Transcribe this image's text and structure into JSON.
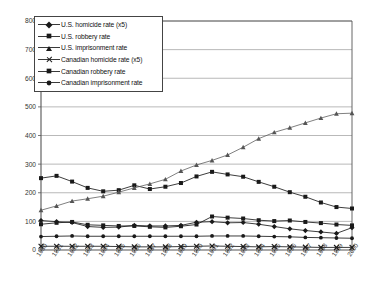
{
  "chart_data": {
    "type": "line",
    "title": "",
    "xlabel": "",
    "ylabel": "",
    "ylim": [
      0,
      800
    ],
    "ytick_values": [
      0,
      100,
      200,
      300,
      400,
      500,
      600,
      700,
      800
    ],
    "ytick_labels": [
      "0",
      "100",
      "200",
      "300",
      "400",
      "500",
      "600",
      "700",
      "800"
    ],
    "grid": true,
    "legend_position": "top-left inside",
    "x": [
      1980,
      1981,
      1982,
      1983,
      1984,
      1985,
      1986,
      1987,
      1988,
      1989,
      1990,
      1991,
      1992,
      1993,
      1994,
      1995,
      1996,
      1997,
      1998,
      1999,
      2000
    ],
    "xtick_labels": [
      "1980",
      "1981",
      "1982",
      "1983",
      "1984",
      "1985",
      "1986",
      "1987",
      "1988",
      "1989",
      "1990",
      "1991",
      "1992",
      "1993",
      "1994",
      "1995",
      "1996",
      "1997",
      "1998",
      "1999",
      "2000"
    ],
    "series": [
      {
        "name": "U.S. homicide rate (x5)",
        "marker": "diamond",
        "color": "#1a1a1a",
        "values": [
          103,
          99,
          96,
          82,
          79,
          80,
          86,
          84,
          84,
          86,
          97,
          99,
          95,
          96,
          90,
          82,
          74,
          68,
          63,
          58,
          78
        ]
      },
      {
        "name": "U.S. robbery rate",
        "marker": "square",
        "color": "#1a1a1a",
        "values": [
          251,
          259,
          239,
          217,
          205,
          209,
          226,
          213,
          221,
          234,
          257,
          273,
          264,
          256,
          238,
          221,
          202,
          186,
          166,
          150,
          145
        ]
      },
      {
        "name": "U.S. imprisonment rate",
        "marker": "triangle",
        "color": "#555555",
        "values": [
          139,
          154,
          171,
          179,
          188,
          202,
          217,
          231,
          247,
          276,
          297,
          313,
          332,
          359,
          389,
          411,
          427,
          444,
          461,
          476,
          478
        ]
      },
      {
        "name": "Canadian homicide rate (x5)",
        "marker": "x",
        "color": "#1a1a1a",
        "values": [
          13,
          13,
          13,
          13,
          13,
          12,
          11,
          11,
          11,
          12,
          13,
          14,
          13,
          12,
          11,
          12,
          11,
          10,
          9,
          9,
          9
        ]
      },
      {
        "name": "Canadian robbery rate",
        "marker": "square",
        "color": "#1a1a1a",
        "values": [
          90,
          95,
          98,
          88,
          86,
          84,
          84,
          81,
          79,
          83,
          89,
          117,
          113,
          110,
          104,
          101,
          103,
          98,
          94,
          89,
          86
        ]
      },
      {
        "name": "Canadian imprisonment rate",
        "marker": "dot",
        "color": "#1a1a1a",
        "values": [
          47,
          48,
          49,
          48,
          48,
          48,
          48,
          48,
          48,
          48,
          48,
          49,
          49,
          49,
          48,
          47,
          46,
          44,
          43,
          42,
          41
        ]
      },
      {
        "name": "U.S. imprisonment rate (upper)",
        "marker": "triangle",
        "color": "#555555",
        "values": [
          null,
          null,
          null,
          null,
          188,
          202,
          217,
          231,
          247,
          276,
          297,
          313,
          332,
          359,
          389,
          411,
          427,
          444,
          461,
          476,
          478
        ]
      }
    ],
    "us_imprisonment_plotted": [
      139,
      154,
      171,
      179,
      188,
      202,
      217,
      231,
      247,
      276,
      297,
      313,
      332,
      359,
      389,
      411,
      427,
      444,
      461,
      476,
      478
    ]
  },
  "legend": {
    "items": [
      {
        "label": "U.S. homicide rate (x5)",
        "marker": "diamond"
      },
      {
        "label": "U.S. robbery rate",
        "marker": "square"
      },
      {
        "label": "U.S. imprisonment rate",
        "marker": "triangle"
      },
      {
        "label": "Canadian homicide rate (x5)",
        "marker": "x"
      },
      {
        "label": "Canadian robbery rate",
        "marker": "square"
      },
      {
        "label": "Canadian imprisonment rate",
        "marker": "dot"
      }
    ]
  },
  "colors": {
    "axis": "#555555",
    "grid": "#8a8a8a",
    "series_dark": "#1a1a1a",
    "series_gray": "#5a5a5a",
    "background": "#ffffff"
  }
}
